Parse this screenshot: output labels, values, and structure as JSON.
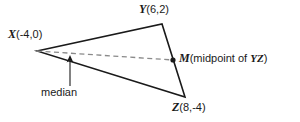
{
  "figure": {
    "background_color": "#ffffff",
    "stroke_color": "#1a1a1a",
    "dash_color": "#8a8a8a",
    "labels": {
      "x": {
        "point": "X",
        "coords": "(-4,0)"
      },
      "y": {
        "point": "Y",
        "coords": "(6,2)"
      },
      "z": {
        "point": "Z",
        "coords": "(8,-4)"
      },
      "m": {
        "point": "M",
        "prefix": "(midpoint of ",
        "segment": "YZ",
        "suffix": ")"
      },
      "median": "median"
    },
    "geometry": {
      "vertices": {
        "X": {
          "px": 37,
          "py": 51,
          "coords": [
            -4,
            0
          ]
        },
        "Y": {
          "px": 162,
          "py": 24,
          "coords": [
            6,
            2
          ]
        },
        "Z": {
          "px": 185,
          "py": 97,
          "coords": [
            8,
            -4
          ]
        },
        "M": {
          "px": 173,
          "py": 60,
          "coords": [
            7,
            -1
          ]
        }
      },
      "median_line": {
        "from": "X",
        "to": "M",
        "style": "dashed"
      },
      "annotation_arrow": {
        "x": 70,
        "from_y": 86,
        "to_y": 56
      }
    }
  }
}
